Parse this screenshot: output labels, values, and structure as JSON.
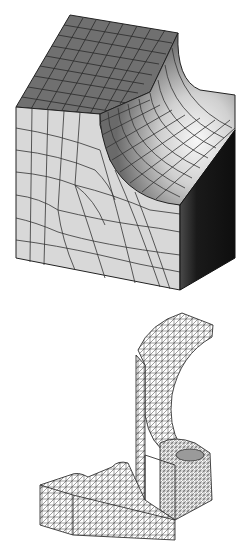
{
  "figures": [
    {
      "id": "cube",
      "description": "Hexahedral structured mesh of a cube with a cylindrical quarter-round cut on one edge",
      "mesh_type": "hexahedral",
      "colors": {
        "top_face": "#6e6e6e",
        "front_face": "#d6d6d6",
        "right_face": "#141414",
        "cut_light": "#f4f4f4",
        "cut_mid": "#a8a8a8",
        "cut_dark": "#5a5a5a",
        "edge": "#222222"
      }
    },
    {
      "id": "bracket",
      "description": "Tetrahedral unstructured mesh of an L-shaped bracket with curved arm",
      "mesh_type": "tetrahedral",
      "colors": {
        "fill": "#ffffff",
        "edge": "#333333"
      }
    }
  ]
}
